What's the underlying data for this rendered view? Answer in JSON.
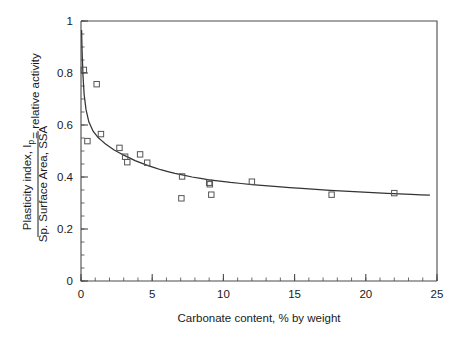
{
  "chart_data": {
    "type": "scatter",
    "title": "",
    "xlabel": "Carbonate content, % by weight",
    "ylabel_numerator": "Plasticity index, I",
    "ylabel_numerator_sub": "p",
    "ylabel_denominator": "Sp. Surface Area, SSA",
    "ylabel_suffix": "= relative activity",
    "xlim": [
      0,
      25
    ],
    "ylim": [
      0,
      1
    ],
    "xticks": [
      0,
      5,
      10,
      15,
      20,
      25
    ],
    "xtick_labels": [
      "0",
      "5",
      "10",
      "15",
      "20",
      "25"
    ],
    "yticks": [
      0,
      0.2,
      0.4,
      0.6,
      0.8,
      1
    ],
    "ytick_labels": [
      "0",
      "0.2",
      "0.4",
      "0.6",
      "0.8",
      "1"
    ],
    "x_minor_interval": 1,
    "y_minor_interval": 0.05,
    "grid": false,
    "legend": "none",
    "marker": "open-square",
    "series": [
      {
        "name": "measured samples",
        "points": [
          {
            "x": 0.2,
            "y": 0.812
          },
          {
            "x": 1.1,
            "y": 0.757
          },
          {
            "x": 0.45,
            "y": 0.538
          },
          {
            "x": 1.4,
            "y": 0.565
          },
          {
            "x": 2.7,
            "y": 0.512
          },
          {
            "x": 3.1,
            "y": 0.478
          },
          {
            "x": 3.25,
            "y": 0.457
          },
          {
            "x": 4.15,
            "y": 0.487
          },
          {
            "x": 4.65,
            "y": 0.455
          },
          {
            "x": 7.1,
            "y": 0.402
          },
          {
            "x": 7.05,
            "y": 0.318
          },
          {
            "x": 9.0,
            "y": 0.378
          },
          {
            "x": 9.05,
            "y": 0.372
          },
          {
            "x": 9.15,
            "y": 0.332
          },
          {
            "x": 12.0,
            "y": 0.382
          },
          {
            "x": 17.6,
            "y": 0.332
          },
          {
            "x": 22.0,
            "y": 0.338
          }
        ]
      }
    ],
    "fit_curve": {
      "name": "power-law fit",
      "points": [
        {
          "x": 0.04,
          "y": 0.965
        },
        {
          "x": 0.08,
          "y": 0.88
        },
        {
          "x": 0.14,
          "y": 0.79
        },
        {
          "x": 0.22,
          "y": 0.718
        },
        {
          "x": 0.35,
          "y": 0.66
        },
        {
          "x": 0.55,
          "y": 0.612
        },
        {
          "x": 0.85,
          "y": 0.576
        },
        {
          "x": 1.2,
          "y": 0.552
        },
        {
          "x": 1.7,
          "y": 0.528
        },
        {
          "x": 2.3,
          "y": 0.505
        },
        {
          "x": 3.0,
          "y": 0.484
        },
        {
          "x": 3.8,
          "y": 0.463
        },
        {
          "x": 4.7,
          "y": 0.444
        },
        {
          "x": 5.6,
          "y": 0.428
        },
        {
          "x": 6.6,
          "y": 0.414
        },
        {
          "x": 7.8,
          "y": 0.4
        },
        {
          "x": 9.0,
          "y": 0.389
        },
        {
          "x": 10.5,
          "y": 0.379
        },
        {
          "x": 12.0,
          "y": 0.371
        },
        {
          "x": 13.8,
          "y": 0.363
        },
        {
          "x": 15.5,
          "y": 0.356
        },
        {
          "x": 17.5,
          "y": 0.349
        },
        {
          "x": 19.5,
          "y": 0.343
        },
        {
          "x": 21.5,
          "y": 0.337
        },
        {
          "x": 23.2,
          "y": 0.333
        },
        {
          "x": 24.5,
          "y": 0.33
        }
      ]
    }
  }
}
